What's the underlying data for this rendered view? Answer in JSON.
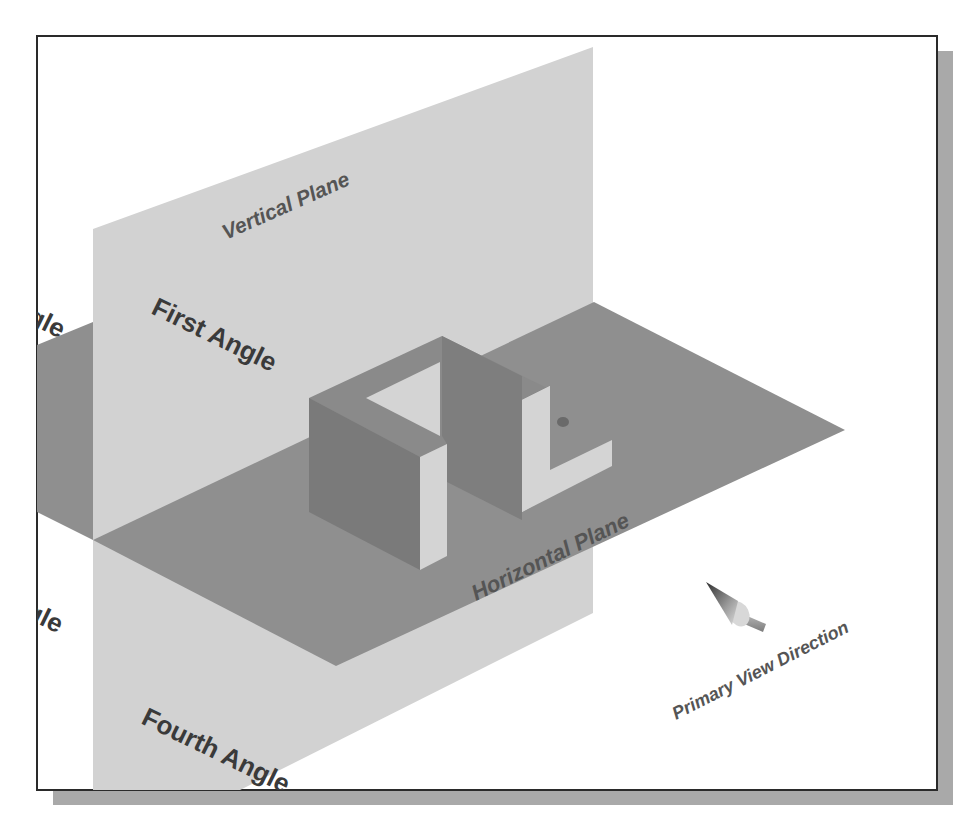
{
  "figure": {
    "colors": {
      "background": "#ffffff",
      "frame_border": "#2a2a2a",
      "shadow": "#a9a9a9",
      "vertical_plane": "#d2d2d2",
      "horizontal_plane": "#8f8f8f",
      "object_dark": "#7a7a7a",
      "object_mid": "#858585",
      "object_light": "#d4d4d4",
      "label_dark": "#3a3a3a",
      "label_italic": "#555555"
    }
  },
  "labels": {
    "vertical_plane": "Vertical Plane",
    "horizontal_plane": "Horizontal Plane",
    "first_angle": "First Angle",
    "fourth_angle": "Fourth Angle",
    "second_angle_partial": "gle",
    "third_angle_partial": "gle",
    "primary_view_direction": "Primary View Direction"
  },
  "icons": {
    "view_direction_arrow": "arrow-icon"
  }
}
